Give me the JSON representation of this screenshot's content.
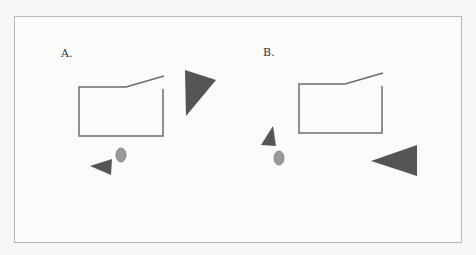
{
  "panels": [
    {
      "label": "A.",
      "label_pos": [
        61,
        57
      ],
      "box": {
        "left": 79,
        "top": 87,
        "right": 163,
        "bottom": 136,
        "lid_start_x": 126,
        "lid_end": [
          164,
          76
        ],
        "right_wall_top": 89
      },
      "big_triangle": "185,70 216,80 186,116",
      "small_triangle": "90,166 112,159 111,175",
      "circle": {
        "cx": 121,
        "cy": 155,
        "rx": 5,
        "ry": 7
      }
    },
    {
      "label": "B.",
      "label_pos": [
        263,
        56
      ],
      "box": {
        "left": 299,
        "top": 84,
        "right": 382,
        "bottom": 133,
        "lid_start_x": 345,
        "lid_end": [
          383,
          73
        ],
        "right_wall_top": 86
      },
      "big_triangle": "371,161 417,145 417,176",
      "small_triangle": "273,126 261,145 276,146",
      "circle": {
        "cx": 279,
        "cy": 158,
        "rx": 5,
        "ry": 7
      }
    }
  ],
  "colors": {
    "line": "#6e6e6e",
    "triangle_fill": "#555555",
    "circle_fill": "#9a9a9a",
    "circle_stroke": "#777777"
  }
}
